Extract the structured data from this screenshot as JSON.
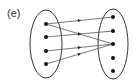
{
  "diagram": {
    "label": "(e)",
    "type": "function-mapping",
    "domain_set": {
      "ellipse": {
        "cx": 46,
        "cy": 44,
        "rx": 16,
        "ry": 34
      },
      "points": [
        {
          "id": "a1",
          "x": 46,
          "y": 24
        },
        {
          "id": "a2",
          "x": 46,
          "y": 37
        },
        {
          "id": "a3",
          "x": 46,
          "y": 51
        },
        {
          "id": "a4",
          "x": 46,
          "y": 64
        }
      ]
    },
    "codomain_set": {
      "ellipse": {
        "cx": 113,
        "cy": 44,
        "rx": 15,
        "ry": 35
      },
      "points": [
        {
          "id": "b1",
          "x": 113,
          "y": 17
        },
        {
          "id": "b2",
          "x": 113,
          "y": 31
        },
        {
          "id": "b3",
          "x": 113,
          "y": 44
        },
        {
          "id": "b4",
          "x": 113,
          "y": 58
        },
        {
          "id": "b5",
          "x": 113,
          "y": 71
        }
      ]
    },
    "arrows": [
      {
        "from": "a1",
        "to": "b1"
      },
      {
        "from": "a1",
        "to": "b3"
      },
      {
        "from": "a2",
        "to": "b2"
      },
      {
        "from": "a3",
        "to": "b3"
      },
      {
        "from": "a4",
        "to": "b3"
      }
    ],
    "colors": {
      "stroke": "#333333",
      "dot": "#111111",
      "line": "#555555"
    }
  }
}
